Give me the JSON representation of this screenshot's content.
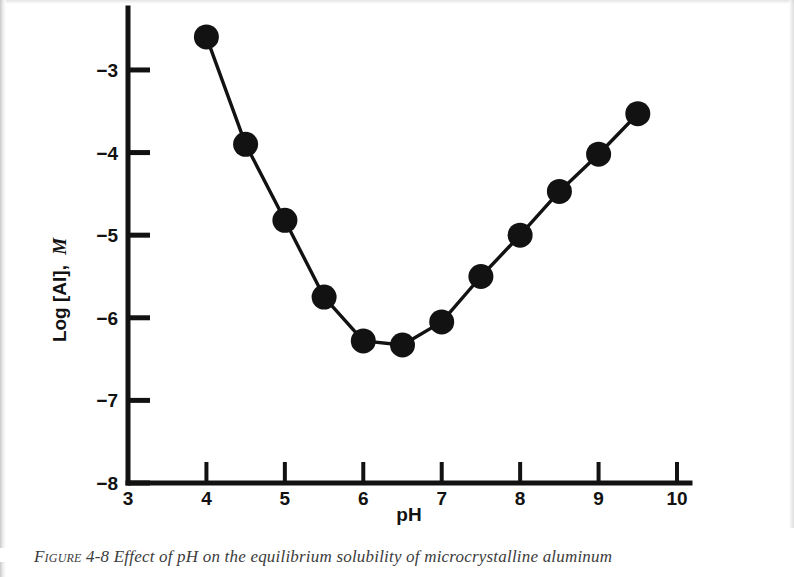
{
  "figure": {
    "caption_label": "Figure 4-8",
    "caption_text": "Effect of pH on the equilibrium solubility of microcrystalline aluminum",
    "ink_color": "#121212",
    "background_color": "#ffffff"
  },
  "axes": {
    "x": {
      "label": "pH",
      "min": 3,
      "max": 10,
      "ticks": [
        3,
        4,
        5,
        6,
        7,
        8,
        9,
        10
      ],
      "tick_labels": [
        "3",
        "4",
        "5",
        "6",
        "7",
        "8",
        "9",
        "10"
      ]
    },
    "y": {
      "label_main": "Log [Al],",
      "label_unit": "M",
      "min": -8,
      "max": -2.25,
      "ticks": [
        -3,
        -4,
        -5,
        -6,
        -7,
        -8
      ],
      "tick_labels": [
        "−3",
        "−4",
        "−5",
        "−6",
        "−7",
        "−8"
      ]
    }
  },
  "chart_data": {
    "type": "line",
    "title": "",
    "subtitle": "",
    "xlabel": "pH",
    "ylabel": "Log [Al], M",
    "xlim": [
      3,
      10
    ],
    "ylim": [
      -8,
      -2.25
    ],
    "grid": false,
    "legend": null,
    "marker": "filled-circle",
    "marker_color": "#121212",
    "line_color": "#121212",
    "x": [
      4.0,
      4.5,
      5.0,
      5.5,
      6.0,
      6.5,
      7.0,
      7.5,
      8.0,
      8.5,
      9.0,
      9.5
    ],
    "values": [
      -2.6,
      -3.9,
      -4.82,
      -5.75,
      -6.28,
      -6.33,
      -6.05,
      -5.5,
      -5.0,
      -4.47,
      -4.02,
      -3.53
    ],
    "series": [
      {
        "name": "microcrystalline aluminum hydroxide solubility",
        "x": [
          4.0,
          4.5,
          5.0,
          5.5,
          6.0,
          6.5,
          7.0,
          7.5,
          8.0,
          8.5,
          9.0,
          9.5
        ],
        "values": [
          -2.6,
          -3.9,
          -4.82,
          -5.75,
          -6.28,
          -6.33,
          -6.05,
          -5.5,
          -5.0,
          -4.47,
          -4.02,
          -3.53
        ]
      }
    ],
    "annotations": []
  }
}
